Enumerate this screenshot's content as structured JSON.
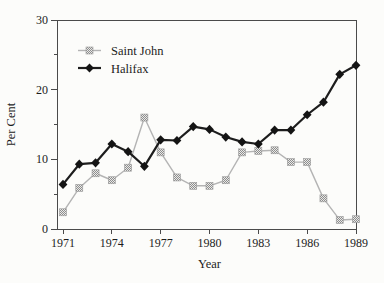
{
  "figure": {
    "background": "#fcfcfa",
    "axis_color": "#4a4a4a",
    "text_color": "#1c1c1c"
  },
  "chart_data": {
    "type": "line",
    "title": "",
    "xlabel": "Year",
    "ylabel": "Per Cent",
    "xlim": [
      1971,
      1989
    ],
    "ylim": [
      0,
      30
    ],
    "x_ticks": [
      1971,
      1974,
      1977,
      1980,
      1983,
      1986,
      1989
    ],
    "y_major_ticks": [
      0,
      10,
      20,
      30
    ],
    "y_minor_ticks": [
      5,
      15,
      25
    ],
    "grid": false,
    "legend_position": "top-left-inside",
    "x": [
      1971,
      1972,
      1973,
      1974,
      1975,
      1976,
      1977,
      1978,
      1979,
      1980,
      1981,
      1982,
      1983,
      1984,
      1985,
      1986,
      1987,
      1988,
      1989
    ],
    "series": [
      {
        "name": "Saint John",
        "marker": "square",
        "line_color": "#b4b4b4",
        "marker_color": "#979797",
        "line_width": 1.4,
        "values": [
          2.4,
          5.9,
          8.0,
          7.0,
          8.8,
          16.0,
          11.0,
          7.4,
          6.2,
          6.2,
          7.0,
          11.0,
          11.2,
          11.3,
          9.6,
          9.6,
          4.4,
          1.3,
          1.4
        ]
      },
      {
        "name": "Halifax",
        "marker": "diamond",
        "line_color": "#1d1d1d",
        "marker_color": "#141414",
        "line_width": 2.2,
        "values": [
          6.4,
          9.3,
          9.5,
          12.2,
          11.1,
          9.0,
          12.8,
          12.7,
          14.7,
          14.3,
          13.2,
          12.5,
          12.2,
          14.2,
          14.2,
          16.4,
          18.2,
          22.2,
          23.5
        ]
      }
    ]
  }
}
